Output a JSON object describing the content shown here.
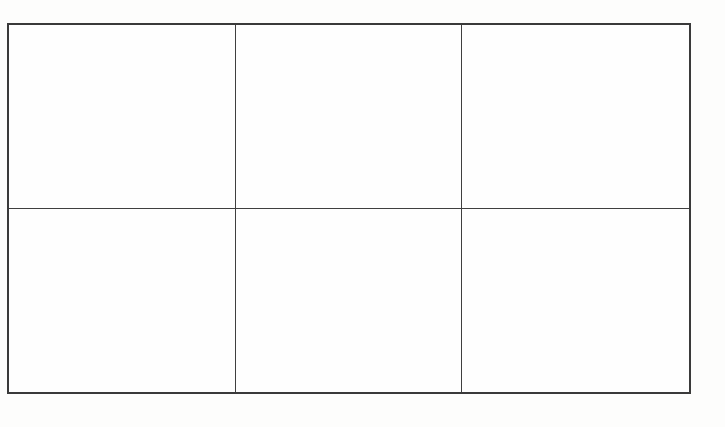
{
  "page": {
    "background_color": "#fdfdfc"
  },
  "table": {
    "rows": 2,
    "columns": 3,
    "border_color": "#3a3a3a",
    "cell_background": "#fefefe",
    "cells": [
      [
        "",
        "",
        ""
      ],
      [
        "",
        "",
        ""
      ]
    ]
  }
}
